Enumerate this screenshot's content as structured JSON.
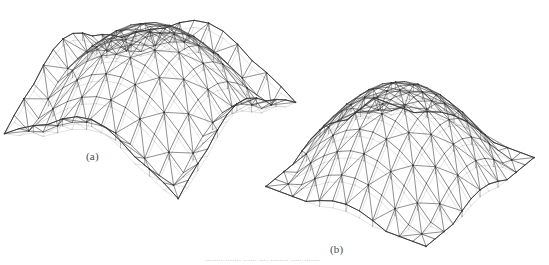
{
  "figure": {
    "background_color": "#ffffff",
    "line_color": "#3a3a3a",
    "faint_line_color": "#9a9a9a",
    "label_color": "#4a4a4a",
    "width": 549,
    "height": 265,
    "type": "engineering-wireframe-figure"
  },
  "labels": {
    "a": "(a)",
    "b": "(b)",
    "caption_sliver": "........  .......  ......  ....  ........  .....  ......."
  },
  "structures": [
    {
      "id": "a",
      "name": "lattice-barrel-dome-a",
      "label": "(a)",
      "kind": "double-layer braced dome on square plan with curved (upswept) free edges",
      "center_x": 150,
      "center_y": 118,
      "radius_x": 152,
      "radius_y": 128,
      "rise": 86,
      "edge_sag": 34,
      "grid_u": 12,
      "grid_v": 12,
      "yaw_deg": 34,
      "pitch_deg": 27,
      "show_diagonals": true,
      "show_second_layer": true,
      "second_layer_offset": 7,
      "stroke_width": 0.62,
      "faint": true
    },
    {
      "id": "b",
      "name": "lattice-barrel-dome-b",
      "label": "(b)",
      "kind": "double-layer braced dome on square plan with straight ground edges",
      "center_x": 400,
      "center_y": 172,
      "radius_x": 140,
      "radius_y": 118,
      "rise": 82,
      "edge_sag": 0,
      "grid_u": 12,
      "grid_v": 12,
      "yaw_deg": 34,
      "pitch_deg": 27,
      "show_diagonals": true,
      "show_second_layer": true,
      "second_layer_offset": 7,
      "stroke_width": 0.62,
      "faint": false
    }
  ],
  "chart_data": {
    "type": "line",
    "title": "",
    "xlabel": "",
    "ylabel": "",
    "legend": [
      "(a)",
      "(b)"
    ],
    "series": [
      {
        "name": "(a)",
        "values": []
      },
      {
        "name": "(b)",
        "values": []
      }
    ]
  }
}
